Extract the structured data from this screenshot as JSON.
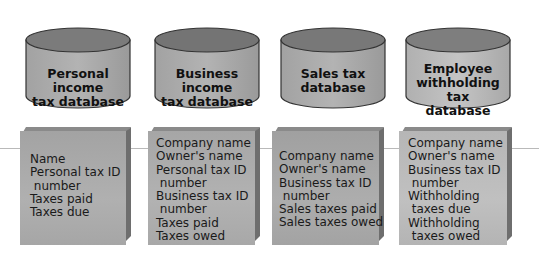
{
  "colors": {
    "cylinder_top": "#7a7a7a",
    "cylinder_body_dark": "#9c9c9c",
    "cylinder_body_light": "#b7b7b7",
    "box_face_dark": "#9e9e9e",
    "box_face_light": "#b9b9b9",
    "box_side": "#6e6e6e",
    "rule_line": "#b9b9b9"
  },
  "databases": [
    {
      "label_lines": [
        "Personal income",
        "tax database"
      ],
      "fields": [
        "Name",
        "Personal tax ID",
        " number",
        "Taxes paid",
        "Taxes due"
      ]
    },
    {
      "label_lines": [
        "Business income",
        "tax database"
      ],
      "fields": [
        "Company name",
        "Owner's name",
        "Personal tax ID",
        " number",
        "Business tax ID",
        " number",
        "Taxes paid",
        "Taxes owed"
      ]
    },
    {
      "label_lines": [
        "Sales tax",
        "database"
      ],
      "fields": [
        "Company name",
        "Owner's name",
        "Business tax ID",
        " number",
        "Sales taxes paid",
        "Sales taxes owed"
      ]
    },
    {
      "label_lines": [
        "Employee",
        "withholding tax",
        "database"
      ],
      "fields": [
        "Company name",
        "Owner's name",
        "Business tax ID",
        " number",
        "Withholding",
        " taxes due",
        "Withholding",
        " taxes owed"
      ]
    }
  ]
}
